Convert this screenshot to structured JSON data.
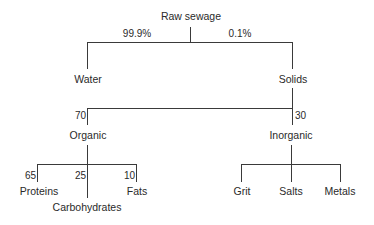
{
  "diagram": {
    "type": "tree",
    "title": "Raw sewage",
    "root": {
      "label": "Raw sewage",
      "children": [
        {
          "label": "Water",
          "edge_label": "99.9%"
        },
        {
          "label": "Solids",
          "edge_label": "0.1%",
          "children": [
            {
              "label": "Organic",
              "edge_label": "70",
              "children": [
                {
                  "label": "Proteins",
                  "edge_label": "65"
                },
                {
                  "label": "Carbohydrates",
                  "edge_label": "25"
                },
                {
                  "label": "Fats",
                  "edge_label": "10"
                }
              ]
            },
            {
              "label": "Inorganic",
              "edge_label": "30",
              "children": [
                {
                  "label": "Grit"
                },
                {
                  "label": "Salts"
                },
                {
                  "label": "Metals"
                }
              ]
            }
          ]
        }
      ]
    },
    "nodes": {
      "raw_sewage": "Raw sewage",
      "water": "Water",
      "solids": "Solids",
      "organic": "Organic",
      "inorganic": "Inorganic",
      "proteins": "Proteins",
      "carbohydrates": "Carbohydrates",
      "fats": "Fats",
      "grit": "Grit",
      "salts": "Salts",
      "metals": "Metals"
    },
    "edge_labels": {
      "water_pct": "99.9%",
      "solids_pct": "0.1%",
      "organic_pct": "70",
      "inorganic_pct": "30",
      "proteins_pct": "65",
      "carbohydrates_pct": "25",
      "fats_pct": "10"
    },
    "colors": {
      "line": "#3a3a3a",
      "text": "#2a2a2a",
      "background": "#ffffff"
    }
  }
}
